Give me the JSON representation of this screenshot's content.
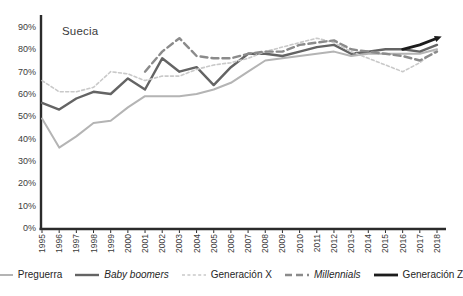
{
  "chart_data": {
    "type": "line",
    "title": "Suecia",
    "xlabel": "",
    "ylabel": "",
    "ylim": [
      0,
      90
    ],
    "ytick_step": 10,
    "yticks": [
      "0%",
      "10%",
      "20%",
      "30%",
      "40%",
      "50%",
      "60%",
      "70%",
      "80%",
      "90%"
    ],
    "grid": false,
    "legend_position": "bottom",
    "axis_color": "#2b2b2b",
    "tick_label_color": "#3c3c3c",
    "x": [
      1995,
      1996,
      1997,
      1998,
      1999,
      2000,
      2001,
      2002,
      2003,
      2004,
      2005,
      2006,
      2007,
      2008,
      2009,
      2010,
      2011,
      2012,
      2013,
      2014,
      2015,
      2016,
      2017,
      2018
    ],
    "series": [
      {
        "id": "preguerra",
        "name": "Preguerra",
        "italic": false,
        "style": "solid",
        "color": "#b4b4b4",
        "width": 2,
        "values": [
          49,
          36,
          41,
          47,
          48,
          54,
          59,
          59,
          59,
          60,
          62,
          65,
          70,
          75,
          76,
          77,
          78,
          79,
          77,
          78,
          78,
          78,
          78,
          80
        ]
      },
      {
        "id": "baby-boomers",
        "name": "Baby boomers",
        "italic": true,
        "style": "solid",
        "color": "#646464",
        "width": 2.4,
        "values": [
          56,
          53,
          58,
          61,
          60,
          67,
          62,
          76,
          70,
          72,
          64,
          72,
          78,
          78,
          77,
          79,
          81,
          82,
          78,
          79,
          80,
          80,
          79,
          82
        ]
      },
      {
        "id": "generacion-x",
        "name": "Generación X",
        "italic": false,
        "style": "dashed",
        "dash": "3,2.4",
        "color": "#c9c9c9",
        "width": 1.6,
        "values": [
          66,
          61,
          61,
          63,
          70,
          69,
          66,
          68,
          68,
          71,
          73,
          74,
          76,
          79,
          81,
          83,
          85,
          83,
          79,
          76,
          73,
          70,
          74,
          80
        ]
      },
      {
        "id": "millennials",
        "name": "Millennials",
        "italic": true,
        "style": "dashed",
        "dash": "7,4",
        "color": "#8b8b8b",
        "width": 2.4,
        "values": [
          null,
          null,
          null,
          null,
          null,
          null,
          70,
          79,
          85,
          77,
          76,
          76,
          78,
          79,
          79,
          82,
          83,
          84,
          80,
          79,
          78,
          77,
          75,
          79
        ]
      },
      {
        "id": "generacion-z",
        "name": "Generación Z",
        "italic": false,
        "style": "solid",
        "color": "#1c1c1c",
        "width": 2.8,
        "arrow_end": true,
        "values": [
          null,
          null,
          null,
          null,
          null,
          null,
          null,
          null,
          null,
          null,
          null,
          null,
          null,
          null,
          null,
          null,
          null,
          null,
          null,
          null,
          null,
          80,
          82,
          85
        ]
      }
    ]
  }
}
